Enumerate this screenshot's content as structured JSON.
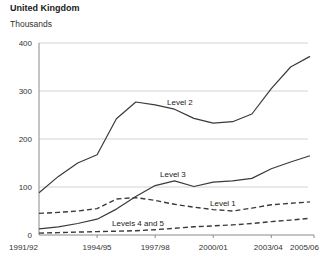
{
  "chart_data": {
    "type": "line",
    "title": "United Kingdom",
    "units": "Thousands",
    "x": [
      "1991/92",
      "1992/93",
      "1993/94",
      "1994/95",
      "1995/96",
      "1996/97",
      "1997/98",
      "1998/99",
      "1999/00",
      "2000/01",
      "2001/02",
      "2002/03",
      "2003/04",
      "2004/05",
      "2005/06"
    ],
    "x_tick_labels": [
      "1991/92",
      "1994/95",
      "1997/98",
      "2000/01",
      "2003/04",
      "2005/06"
    ],
    "ylim": [
      0,
      400
    ],
    "yticks": [
      0,
      100,
      200,
      300,
      400
    ],
    "grid": "horizontal",
    "legend": "inline-labels",
    "series": [
      {
        "name": "Level 2",
        "style": "solid",
        "label_x": 167,
        "label_y": 105,
        "values": [
          88,
          122,
          150,
          167,
          242,
          277,
          271,
          262,
          243,
          233,
          236,
          252,
          305,
          350,
          372
        ]
      },
      {
        "name": "Level 3",
        "style": "solid",
        "label_x": 160,
        "label_y": 177,
        "values": [
          13,
          17,
          24,
          33,
          54,
          80,
          103,
          113,
          101,
          110,
          113,
          118,
          138,
          152,
          165
        ]
      },
      {
        "name": "Level 1",
        "style": "dashed",
        "label_x": 210,
        "label_y": 206,
        "values": [
          45,
          47,
          50,
          55,
          75,
          78,
          72,
          64,
          58,
          53,
          50,
          56,
          63,
          66,
          69
        ]
      },
      {
        "name": "Levels 4 and 5",
        "style": "dashed",
        "label_x": 112,
        "label_y": 226,
        "values": [
          4,
          5,
          6,
          7,
          8,
          9,
          11,
          14,
          17,
          19,
          21,
          24,
          28,
          31,
          35
        ]
      }
    ]
  },
  "colors": {
    "line": "#3a3a3a",
    "grid": "#c8c8c8",
    "axis": "#8a8a8a",
    "tick_text": "#333333",
    "label_text": "#222222",
    "title_text": "#1a1a1a"
  }
}
